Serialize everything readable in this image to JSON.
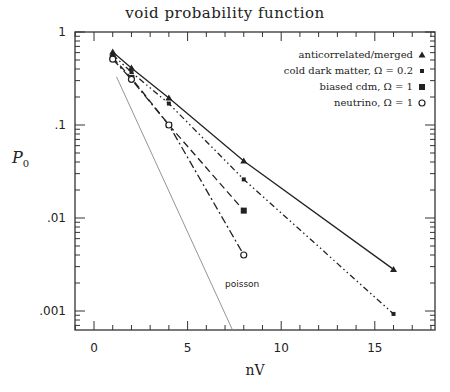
{
  "chart_data": {
    "type": "line",
    "title": "void probability function",
    "xlabel": "nV",
    "ylabel": "P0",
    "ylabel_main": "P",
    "ylabel_sub": "0",
    "yscale": "log",
    "xlim": [
      -1.2,
      18
    ],
    "ylim": [
      0.0006,
      1
    ],
    "xticks": [
      0,
      5,
      10,
      15
    ],
    "xtick_labels": [
      "0",
      "5",
      "10",
      "15"
    ],
    "yticks": [
      1,
      0.1,
      0.01,
      0.001
    ],
    "ytick_labels": [
      "1",
      ".1",
      ".01",
      ".001"
    ],
    "grid": false,
    "legend_position": "upper right",
    "series": [
      {
        "name": "anticorrelated/merged",
        "marker": "triangle",
        "linestyle": "solid",
        "x": [
          1,
          2,
          4,
          8,
          16
        ],
        "y": [
          0.61,
          0.41,
          0.195,
          0.041,
          0.0028
        ]
      },
      {
        "name": "cold dark matter, Ω = 0.2",
        "marker": "x",
        "linestyle": "dashdotdot",
        "x": [
          1,
          2,
          4,
          8,
          16
        ],
        "y": [
          0.57,
          0.37,
          0.17,
          0.026,
          0.00093
        ]
      },
      {
        "name": "biased cdm, Ω = 1",
        "marker": "square",
        "linestyle": "dashed",
        "x": [
          1,
          2,
          4,
          8
        ],
        "y": [
          0.53,
          0.32,
          0.1,
          0.012
        ]
      },
      {
        "name": "neutrino, Ω = 1",
        "marker": "circle",
        "linestyle": "dashdot",
        "x": [
          1,
          2,
          4,
          8
        ],
        "y": [
          0.51,
          0.31,
          0.1,
          0.004
        ]
      },
      {
        "name": "poisson",
        "marker": "none",
        "linestyle": "thin-gray",
        "x": [
          1.2,
          7.4
        ],
        "y": [
          0.33,
          0.0006
        ]
      }
    ],
    "annotations": [
      {
        "text": "poisson",
        "x": 8.2,
        "y": 0.0017
      }
    ]
  }
}
